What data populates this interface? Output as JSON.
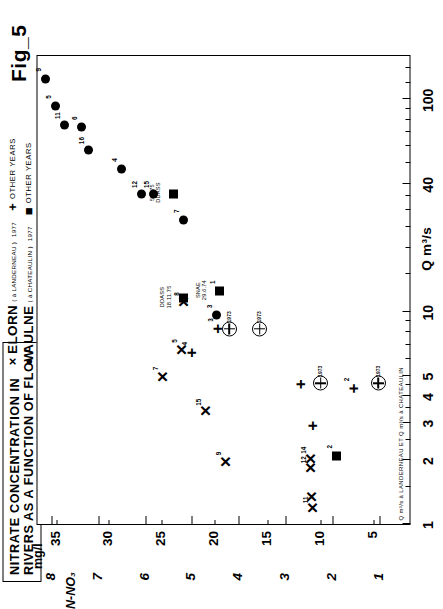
{
  "figure": {
    "label": "Fig_5"
  },
  "title_box": {
    "line1": "NITRATE CONCENTRATION IN",
    "line2": "RIVERS AS A FUNCTION OF FLOW"
  },
  "legend": {
    "rows": [
      {
        "marker": "×",
        "name": "ELORN",
        "sub": "( à  LANDERNEAU )",
        "year": "1977",
        "other_marker": "+",
        "other_label": "OTHER  YEARS"
      },
      {
        "marker": "●",
        "name": "AULNE",
        "sub": "( à  CHATEAULIN )",
        "year": "1977",
        "other_marker": "■",
        "other_label": "OTHER  YEARS"
      }
    ]
  },
  "chart_data": {
    "type": "scatter",
    "title": "NITRATE CONCENTRATION IN RIVERS AS A FUNCTION OF FLOW",
    "xlabel": "Q m³/s",
    "ylabel": "mg/l  /  N-NO₃",
    "xscale": "log",
    "xlim": [
      1,
      160
    ],
    "xticks": [
      1,
      2,
      3,
      4,
      5,
      10,
      40,
      100
    ],
    "xticklabels": [
      "1",
      "2",
      "3",
      "4",
      "5",
      "10",
      "40",
      "100"
    ],
    "x_footnote": "Q m³/s à LANDERNEAU  ET  Q m³/s à CHATEAULIN",
    "y_unit_primary": "mg/l",
    "y_unit_secondary": "N-NO₃",
    "yticks_primary": [
      35,
      30,
      25,
      20,
      15,
      10,
      5
    ],
    "yticks_secondary": [
      8,
      7,
      6,
      5,
      4,
      3,
      2,
      1
    ],
    "ylim_secondary": [
      0.35,
      8.3
    ],
    "grid": false,
    "legend_position": "top-right",
    "series": [
      {
        "name": "AULNE (à CHATEAULIN) 1977",
        "marker": "circle",
        "points": [
          {
            "label": "11",
            "q": 76,
            "n": 7.72
          },
          {
            "label": "5",
            "q": 93,
            "n": 7.92
          },
          {
            "label": "9",
            "q": 125,
            "n": 8.12
          },
          {
            "label": "6",
            "q": 74,
            "n": 7.37
          },
          {
            "label": "16",
            "q": 58,
            "n": 7.2
          },
          {
            "label": "4",
            "q": 47,
            "n": 6.5
          },
          {
            "label": "12",
            "q": 36,
            "n": 6.08
          },
          {
            "label": "15",
            "q": 36,
            "n": 5.83
          },
          {
            "label": "7",
            "q": 27,
            "n": 5.18
          },
          {
            "label": "3",
            "q": 9.6,
            "n": 4.47
          }
        ]
      },
      {
        "name": "ELORN (à LANDERNEAU) 1977",
        "marker": "cross",
        "points": [
          {
            "label": "7",
            "q": 4.9,
            "n": 5.62
          },
          {
            "label": "5",
            "q": 6.6,
            "n": 5.22
          },
          {
            "label": "8",
            "q": 11.0,
            "n": 5.18
          },
          {
            "label": "15",
            "q": 3.4,
            "n": 4.72
          },
          {
            "label": "9",
            "q": 1.95,
            "n": 4.28
          },
          {
            "label": "11",
            "q": 1.18,
            "n": 2.42
          },
          {
            "label": "",
            "q": 1.33,
            "n": 2.45
          },
          {
            "label": "12",
            "q": 1.82,
            "n": 2.47
          },
          {
            "label": "14",
            "q": 2.02,
            "n": 2.47
          }
        ]
      },
      {
        "name": "ELORN other years",
        "marker": "plus",
        "points": [
          {
            "label": "4",
            "q": 6.4,
            "n": 5.0
          },
          {
            "label": "3",
            "q": 8.3,
            "n": 4.45
          },
          {
            "label": "2",
            "q": 4.35,
            "n": 1.55
          },
          {
            "label": "",
            "q": 2.9,
            "n": 2.43
          },
          {
            "label": "",
            "q": 4.55,
            "n": 2.67
          }
        ]
      },
      {
        "name": "AULNE other years",
        "marker": "square",
        "points": [
          {
            "label": "",
            "q": 36,
            "n": 5.4,
            "annotation": "5.3.75\nDDASS"
          },
          {
            "label": "",
            "q": 11.6,
            "n": 5.18,
            "annotation": "DDASS\n18.11.75"
          },
          {
            "label": "1",
            "q": 12.5,
            "n": 4.42,
            "annotation": "SNAE\n29.6.74"
          },
          {
            "label": "2",
            "q": 2.1,
            "n": 1.9
          }
        ]
      },
      {
        "name": "ELORN 1973 (circled plus)",
        "marker": "circled-plus",
        "points": [
          {
            "label": "1973",
            "q": 8.3,
            "n": 4.2
          },
          {
            "label": "1973",
            "q": 8.3,
            "n": 3.55
          },
          {
            "label": "1973",
            "q": 4.6,
            "n": 2.25
          },
          {
            "label": "1973",
            "q": 4.6,
            "n": 1.02
          }
        ]
      }
    ]
  }
}
